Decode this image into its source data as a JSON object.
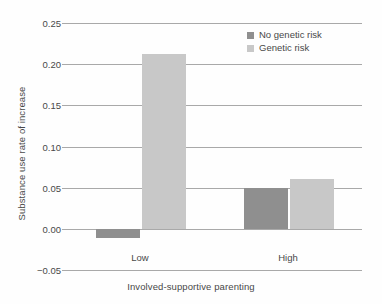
{
  "chart_data": {
    "type": "bar",
    "title": "",
    "subtitle": "",
    "xlabel": "Involved-supportive parenting",
    "ylabel": "Substance use rate of increase",
    "categories": [
      "Low",
      "High"
    ],
    "series": [
      {
        "name": "No genetic risk",
        "color": "#8f8f8f",
        "values": [
          -0.011,
          0.05
        ]
      },
      {
        "name": "Genetic risk",
        "color": "#c8c8c8",
        "values": [
          0.212,
          0.061
        ]
      }
    ],
    "ylim": [
      -0.05,
      0.25
    ],
    "yticks": [
      0.25,
      0.2,
      0.15,
      0.1,
      0.05,
      0.0,
      -0.05
    ],
    "ytick_labels": [
      "0.25",
      "0.20",
      "0.15",
      "0.10",
      "0.05",
      "0.00",
      "−0.05"
    ],
    "grid": true,
    "grid_axis": "y",
    "legend_position": "top-right",
    "background_color": "#fefefe",
    "gridline_color": "#a9a9a9",
    "text_color": "#484848"
  },
  "legend": {
    "items": [
      {
        "label": "No genetic risk",
        "swatch": "#8f8f8f"
      },
      {
        "label": "Genetic risk",
        "swatch": "#c8c8c8"
      }
    ]
  }
}
